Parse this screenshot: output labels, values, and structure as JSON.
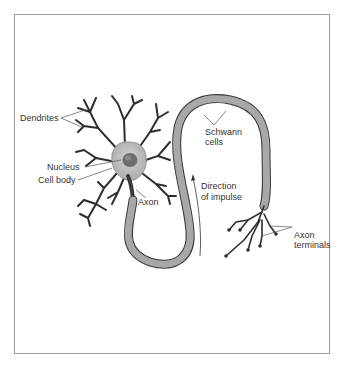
{
  "diagram": {
    "labels": {
      "dendrites": "Dendrites",
      "nucleus": "Nucleus",
      "cell_body": "Cell body",
      "axon": "Axon",
      "schwann_line1": "Schwann",
      "schwann_line2": "cells",
      "direction_line1": "Direction",
      "direction_line2": "of impulse",
      "terminals_line1": "Axon",
      "terminals_line2": "terminals"
    },
    "colors": {
      "cell_body": "#bdbdbd",
      "nucleus": "#6e6e6e",
      "schwann": "#a8a8a8",
      "outline": "#3a3a3a",
      "dendrite": "#2e2e2e",
      "frame": "#9a9a9a"
    }
  }
}
